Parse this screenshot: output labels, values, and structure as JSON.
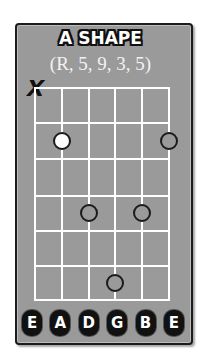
{
  "diagram": {
    "title": "A SHAPE",
    "subtitle": "(R, 5, 9, 3, 5)",
    "muted_marker": "X",
    "muted_string": "E (low)",
    "strings": [
      "E",
      "A",
      "D",
      "G",
      "B",
      "E"
    ],
    "frets_shown": 6,
    "notes": [
      {
        "string": "A",
        "string_index": 1,
        "fret": 2,
        "type": "root"
      },
      {
        "string": "E (high)",
        "string_index": 5,
        "fret": 2,
        "type": "note"
      },
      {
        "string": "D",
        "string_index": 2,
        "fret": 4,
        "type": "note"
      },
      {
        "string": "B",
        "string_index": 4,
        "fret": 4,
        "type": "note"
      },
      {
        "string": "G",
        "string_index": 3,
        "fret": 6,
        "type": "note"
      }
    ],
    "colors": {
      "card_background": "#9a9a9a",
      "grid_lines": "#ffffff",
      "root_dot": "#ffffff",
      "outline": "#111111"
    }
  }
}
